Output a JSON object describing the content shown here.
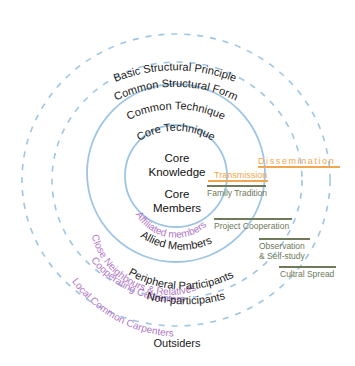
{
  "diagram": {
    "center": {
      "knowledge": [
        "Core",
        "Knowledge"
      ],
      "members": [
        "Core",
        "Members"
      ]
    },
    "ring_labels_top": {
      "basic_structural_principle": "Basic Structural Principle",
      "common_structural_form": "Common Structural Form",
      "common_technique": "Common Technique",
      "core_technique": "Core Technique"
    },
    "ring_labels_bottom": {
      "allied_members": "Allied Members",
      "peripheral_participants": "Peripheral Participants",
      "non_participants": "Non-participants",
      "outsiders": "Outsiders"
    },
    "purple_labels": {
      "affiliated_members": "Affiliated members",
      "close_neighbours": "Close Neighbours & Relatives",
      "cooperating_carpenters": "Cooperating Carpenters",
      "local_common_carpenters": "Local Common Carpenters"
    },
    "orange_labels": {
      "transmission": "Transmission",
      "dissemination": "Dissemination"
    },
    "green_labels": {
      "family_tradition": "Family Tradition",
      "project_cooperation": "Project Cooperation",
      "observation_1": "Observation",
      "observation_2": "& Self-study",
      "cultural_spread": "Cultral Spread"
    },
    "colors": {
      "circle_blue": "#9ec6e4",
      "purple_text": "#b276c8",
      "orange": "#f0a850",
      "green": "#6e7a5a",
      "text": "#1a1a1a"
    }
  }
}
